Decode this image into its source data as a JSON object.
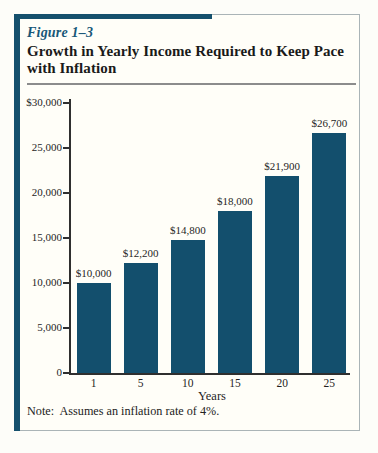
{
  "figure": {
    "label": "Figure 1–3",
    "title": "Growth in Yearly Income Required to Keep Pace with Inflation",
    "note": "Note:  Assumes an inflation rate of 4%."
  },
  "chart_data": {
    "type": "bar",
    "title": "Growth in Yearly Income Required to Keep Pace with Inflation",
    "categories": [
      "1",
      "5",
      "10",
      "15",
      "20",
      "25"
    ],
    "values": [
      10000,
      12200,
      14800,
      18000,
      21900,
      26700
    ],
    "bar_labels": [
      "$10,000",
      "$12,200",
      "$14,800",
      "$18,000",
      "$21,900",
      "$26,700"
    ],
    "xlabel": "Years",
    "ylabel": "",
    "ylim": [
      0,
      30000
    ],
    "ytick_values": [
      30000,
      25000,
      20000,
      15000,
      10000,
      5000,
      0
    ],
    "ytick_labels": [
      "$30,000",
      "25,000",
      "20,000",
      "15,000",
      "10,000",
      "5,000",
      "0"
    ],
    "grid": false,
    "legend": "none",
    "bar_color": "#134f6d"
  },
  "colors": {
    "accent_frame": "#15506d",
    "figure_label_text": "#175878",
    "border_gray": "#aab4b7",
    "rule_gray": "#8c8c8c",
    "axis": "#2f2f2f",
    "text": "#1f1f1f",
    "frame_background": "#fffef8"
  }
}
